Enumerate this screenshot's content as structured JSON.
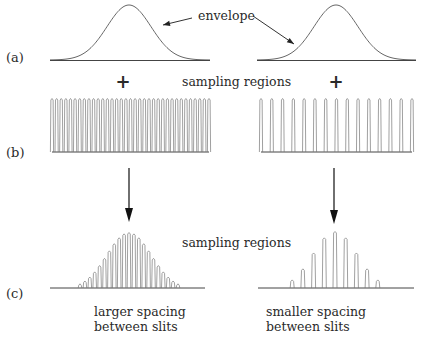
{
  "figure": {
    "row_labels": [
      "(a)",
      "(b)",
      "(c)"
    ],
    "envelope_label": "envelope",
    "sampling_label_top": "sampling regions",
    "sampling_label_bottom": "sampling regions",
    "plus_sign": "+",
    "left_caption": [
      "larger spacing",
      "between slits"
    ],
    "right_caption": [
      "smaller spacing",
      "between slits"
    ],
    "panels": {
      "left": {
        "description": "larger spacing between slits",
        "comb_peak_count": 35,
        "result_peak_count": 21
      },
      "right": {
        "description": "smaller spacing between slits",
        "comb_peak_count": 15,
        "result_peak_count": 9
      }
    },
    "colors": {
      "ink": "#222222",
      "trace": "#777777",
      "background": "#ffffff"
    }
  }
}
